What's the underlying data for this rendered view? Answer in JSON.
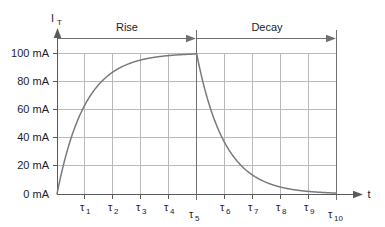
{
  "figure": {
    "background_color": "#ffffff",
    "curve_color": "#7a7a7a",
    "grid_color": "#b9b9b9",
    "axis_color": "#5a5a5a",
    "text_color": "#1d1d1d"
  },
  "axes": {
    "y_axis_name": "I",
    "y_axis_subscript": "T",
    "x_axis_name": "t"
  },
  "annotations": {
    "rise_label": "Rise",
    "decay_label": "Decay"
  },
  "chart_data": {
    "type": "line",
    "title": "",
    "subtitle": "",
    "xlabel": "t",
    "ylabel": "I_T",
    "grid": true,
    "legend": null,
    "xlim": [
      0,
      10
    ],
    "ylim": [
      0,
      100
    ],
    "x_tick_labels": [
      "τ₁",
      "τ₂",
      "τ₃",
      "τ₄",
      "τ₅",
      "τ₆",
      "τ₇",
      "τ₈",
      "τ₉",
      "τ₁₀"
    ],
    "x_tick_bases": [
      "τ",
      "τ",
      "τ",
      "τ",
      "τ",
      "τ",
      "τ",
      "τ",
      "τ",
      "τ"
    ],
    "x_tick_subscripts": [
      "1",
      "2",
      "3",
      "4",
      "5",
      "6",
      "7",
      "8",
      "9",
      "10"
    ],
    "x_tick_values": [
      1,
      2,
      3,
      4,
      5,
      6,
      7,
      8,
      9,
      10
    ],
    "y_tick_labels": [
      "0 mA",
      "20 mA",
      "40 mA",
      "60 mA",
      "80 mA",
      "100 mA"
    ],
    "y_tick_values": [
      0,
      20,
      40,
      60,
      80,
      100
    ],
    "y_unit": "mA",
    "series": [
      {
        "name": "Rise",
        "phase": "rise",
        "equation": "I = 100 * (1 - exp(-t/τ))",
        "x": [
          0,
          0.25,
          0.5,
          0.75,
          1,
          1.5,
          2,
          2.5,
          3,
          3.5,
          4,
          4.5,
          5
        ],
        "values": [
          0,
          22.1,
          39.3,
          52.8,
          63.2,
          77.7,
          86.5,
          91.8,
          95.0,
          97.0,
          98.2,
          98.9,
          99.3
        ]
      },
      {
        "name": "Decay",
        "phase": "decay",
        "equation": "I = 100 * exp(-(t-5)/τ)",
        "x": [
          5,
          5.25,
          5.5,
          5.75,
          6,
          6.5,
          7,
          7.5,
          8,
          8.5,
          9,
          9.5,
          10
        ],
        "values": [
          100,
          77.9,
          60.7,
          47.2,
          36.8,
          22.3,
          13.5,
          8.2,
          5.0,
          3.0,
          1.8,
          1.1,
          0.7
        ]
      }
    ],
    "annotations": [
      {
        "text": "Rise",
        "from_x": 0,
        "to_x": 5,
        "kind": "span-arrow"
      },
      {
        "text": "Decay",
        "from_x": 5,
        "to_x": 10,
        "kind": "span-arrow"
      }
    ]
  }
}
